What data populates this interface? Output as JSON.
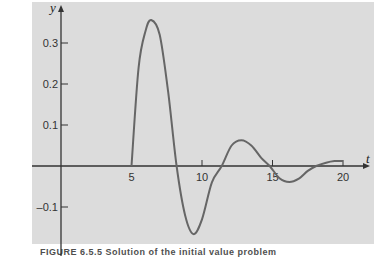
{
  "chart_data": {
    "type": "line",
    "title": "",
    "xlabel": "t",
    "ylabel": "y",
    "xlim": [
      0,
      21
    ],
    "ylim": [
      -0.18,
      0.38
    ],
    "grid": false,
    "x_ticks": [
      5,
      10,
      15,
      20
    ],
    "x_tick_labels": [
      "5",
      "10",
      "15",
      "20"
    ],
    "y_ticks": [
      0.3,
      0.2,
      0.1,
      -0.1
    ],
    "y_tick_labels": [
      "0.3",
      "0.2",
      "0.1",
      "–0.1"
    ],
    "series": [
      {
        "name": "y(t)",
        "color": "#666666",
        "x": [
          5,
          5.5,
          6.0,
          6.4,
          7.0,
          7.6,
          8.2,
          8.8,
          9.4,
          10.0,
          10.7,
          11.4,
          12.1,
          12.8,
          13.5,
          14.2,
          14.8,
          15.5,
          16.2,
          16.9,
          17.5,
          18.1,
          18.8,
          19.4,
          20.0
        ],
        "y": [
          0,
          0.24,
          0.33,
          0.356,
          0.32,
          0.18,
          0.0,
          -0.12,
          -0.166,
          -0.13,
          -0.04,
          0.0,
          0.05,
          0.063,
          0.05,
          0.02,
          0.0,
          -0.03,
          -0.039,
          -0.03,
          -0.012,
          0.0,
          0.008,
          0.012,
          0.012
        ]
      }
    ]
  },
  "caption": {
    "text": "FIGURE 6.5.5 Solution of the initial value problem"
  }
}
